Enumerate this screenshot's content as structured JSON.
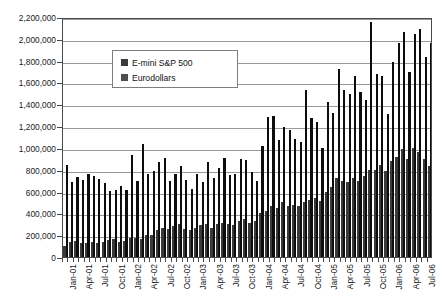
{
  "chart_data": {
    "type": "bar",
    "title": "",
    "xlabel": "",
    "ylabel": "",
    "ylim": [
      0,
      2200000
    ],
    "ytick_step": 200000,
    "grid": true,
    "legend_position": "upper-left-inside",
    "ytick_labels": [
      "0",
      "200,000",
      "400,000",
      "600,000",
      "800,000",
      "1,000,000",
      "1,200,000",
      "1,400,000",
      "1,600,000",
      "1,800,000",
      "2,000,000",
      "2,200,000"
    ],
    "categories": [
      "Jan-01",
      "Feb-01",
      "Mar-01",
      "Apr-01",
      "May-01",
      "Jun-01",
      "Jul-01",
      "Aug-01",
      "Sep-01",
      "Oct-01",
      "Nov-01",
      "Dec-01",
      "Jan-02",
      "Feb-02",
      "Mar-02",
      "Apr-02",
      "May-02",
      "Jun-02",
      "Jul-02",
      "Aug-02",
      "Sep-02",
      "Oct-02",
      "Nov-02",
      "Dec-02",
      "Jan-03",
      "Feb-03",
      "Mar-03",
      "Apr-03",
      "May-03",
      "Jun-03",
      "Jul-03",
      "Aug-03",
      "Sep-03",
      "Oct-03",
      "Nov-03",
      "Dec-03",
      "Jan-04",
      "Feb-04",
      "Mar-04",
      "Apr-04",
      "May-04",
      "Jun-04",
      "Jul-04",
      "Aug-04",
      "Sep-04",
      "Oct-04",
      "Nov-04",
      "Dec-04",
      "Jan-05",
      "Feb-05",
      "Mar-05",
      "Apr-05",
      "May-05",
      "Jun-05",
      "Jul-05",
      "Aug-05",
      "Sep-05",
      "Oct-05",
      "Nov-05",
      "Dec-05",
      "Jan-06",
      "Feb-06",
      "Mar-06",
      "Apr-06",
      "May-06",
      "Jun-06",
      "Jul-06",
      "Aug-06"
    ],
    "tick_label_every": 3,
    "series": [
      {
        "name": "E-mini S&P 500",
        "color": "#3a3a3a",
        "values": [
          105000,
          135000,
          150000,
          130000,
          125000,
          140000,
          125000,
          140000,
          160000,
          165000,
          140000,
          150000,
          170000,
          175000,
          165000,
          200000,
          200000,
          250000,
          265000,
          255000,
          280000,
          300000,
          255000,
          250000,
          270000,
          290000,
          300000,
          270000,
          300000,
          310000,
          300000,
          290000,
          330000,
          345000,
          310000,
          330000,
          400000,
          420000,
          470000,
          450000,
          500000,
          470000,
          480000,
          470000,
          500000,
          520000,
          540000,
          510000,
          600000,
          640000,
          720000,
          700000,
          690000,
          720000,
          700000,
          740000,
          800000,
          800000,
          840000,
          790000,
          880000,
          920000,
          990000,
          900000,
          1000000,
          960000,
          900000,
          830000
        ]
      },
      {
        "name": "Eurodollars",
        "color": "#0d0d0d",
        "values": [
          840000,
          690000,
          730000,
          705000,
          760000,
          740000,
          715000,
          675000,
          605000,
          610000,
          650000,
          610000,
          935000,
          700000,
          1040000,
          760000,
          790000,
          870000,
          910000,
          700000,
          760000,
          830000,
          705000,
          620000,
          760000,
          690000,
          870000,
          720000,
          820000,
          905000,
          750000,
          760000,
          900000,
          890000,
          780000,
          700000,
          1020000,
          1280000,
          1290000,
          1070000,
          1190000,
          1160000,
          1080000,
          1050000,
          1530000,
          1270000,
          1240000,
          1000000,
          1420000,
          1320000,
          1720000,
          1530000,
          1490000,
          1660000,
          1510000,
          1440000,
          2150000,
          1680000,
          1660000,
          1310000,
          1790000,
          1960000,
          2060000,
          1700000,
          2040000,
          2090000,
          1830000,
          1960000
        ]
      }
    ]
  }
}
